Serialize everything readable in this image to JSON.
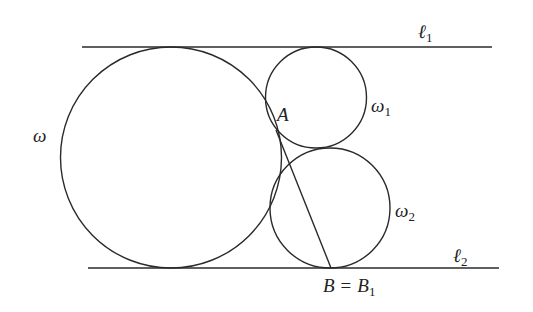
{
  "diagram": {
    "title": "",
    "colors": {
      "stroke": "#2a2a2a",
      "text": "#222222",
      "background": "#ffffff"
    },
    "lines": [
      {
        "id": "l1",
        "label": "ℓ",
        "subscript": "1",
        "x1": 82,
        "y1": 47,
        "x2": 492,
        "y2": 47
      },
      {
        "id": "l2",
        "label": "ℓ",
        "subscript": "2",
        "x1": 88,
        "y1": 268,
        "x2": 499,
        "y2": 268
      },
      {
        "id": "AB",
        "label": "",
        "x1": 276,
        "y1": 130,
        "x2": 331,
        "y2": 268
      }
    ],
    "circles": [
      {
        "id": "omega",
        "label": "ω",
        "subscript": "",
        "cx": 171,
        "cy": 157.5,
        "r": 110.5
      },
      {
        "id": "omega1",
        "label": "ω",
        "subscript": "1",
        "cx": 316,
        "cy": 97.5,
        "r": 50.5
      },
      {
        "id": "omega2",
        "label": "ω",
        "subscript": "2",
        "cx": 330,
        "cy": 208,
        "r": 60
      }
    ],
    "points": [
      {
        "id": "A",
        "label": "A",
        "x": 276,
        "y": 130
      },
      {
        "id": "B",
        "label": "B",
        "equals": "=",
        "alt_label": "B",
        "alt_subscript": "1",
        "x": 331,
        "y": 268
      }
    ],
    "labels": {
      "l1_main": "ℓ",
      "l1_sub": "1",
      "l2_main": "ℓ",
      "l2_sub": "2",
      "omega": "ω",
      "omega1_main": "ω",
      "omega1_sub": "1",
      "omega2_main": "ω",
      "omega2_sub": "2",
      "A": "A",
      "B": "B",
      "equals": "=",
      "B1_main": "B",
      "B1_sub": "1"
    }
  }
}
